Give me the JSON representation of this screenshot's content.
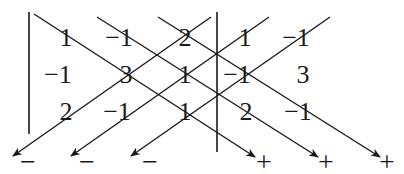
{
  "matrix": {
    "rows": [
      [
        "1",
        "−1",
        "2"
      ],
      [
        "−1",
        "3",
        "1"
      ],
      [
        "2",
        "−1",
        "1"
      ]
    ]
  },
  "appended_columns": {
    "rows": [
      [
        "1",
        "−1"
      ],
      [
        "−1",
        "3"
      ],
      [
        "2",
        "−1"
      ]
    ]
  },
  "cells": [
    {
      "row": 0,
      "col": 0,
      "value": "1",
      "x": 66,
      "y": 46
    },
    {
      "row": 0,
      "col": 1,
      "value": "−1",
      "x": 119,
      "y": 46
    },
    {
      "row": 0,
      "col": 2,
      "value": "2",
      "x": 185,
      "y": 46
    },
    {
      "row": 0,
      "col": 3,
      "value": "1",
      "x": 245,
      "y": 46
    },
    {
      "row": 0,
      "col": 4,
      "value": "−1",
      "x": 296,
      "y": 46
    },
    {
      "row": 1,
      "col": 0,
      "value": "−1",
      "x": 58,
      "y": 83
    },
    {
      "row": 1,
      "col": 1,
      "value": "3",
      "x": 126,
      "y": 83
    },
    {
      "row": 1,
      "col": 2,
      "value": "1",
      "x": 185,
      "y": 83
    },
    {
      "row": 1,
      "col": 3,
      "value": "−1",
      "x": 237,
      "y": 83
    },
    {
      "row": 1,
      "col": 4,
      "value": "3",
      "x": 303,
      "y": 83
    },
    {
      "row": 2,
      "col": 0,
      "value": "2",
      "x": 66,
      "y": 120
    },
    {
      "row": 2,
      "col": 1,
      "value": "−1",
      "x": 117,
      "y": 120
    },
    {
      "row": 2,
      "col": 2,
      "value": "1",
      "x": 185,
      "y": 120
    },
    {
      "row": 2,
      "col": 3,
      "value": "2",
      "x": 246,
      "y": 120
    },
    {
      "row": 2,
      "col": 4,
      "value": "−1",
      "x": 298,
      "y": 120
    }
  ],
  "signs": {
    "minus": [
      "−",
      "−",
      "−"
    ],
    "plus": [
      "+",
      "+",
      "+"
    ]
  },
  "diagonals": {
    "positive_direction": "down-right",
    "negative_direction": "down-left",
    "positive_label": "+",
    "negative_label": "−"
  },
  "colors": {
    "ink": "#1a1a1a",
    "background": "#ffffff"
  }
}
